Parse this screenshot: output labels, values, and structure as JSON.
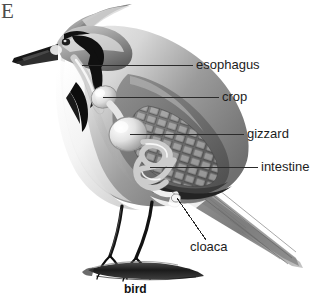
{
  "figure": {
    "panel_letter": "E",
    "caption": "bird",
    "background_color": "#ffffff",
    "label_color": "#1d1d1d",
    "leader_line_color": "#2b2b2b",
    "subject": "bird",
    "illustration_style": "grayscale anatomical drawing"
  },
  "labels": [
    {
      "id": "esophagus",
      "text": "esophagus"
    },
    {
      "id": "crop",
      "text": "crop"
    },
    {
      "id": "gizzard",
      "text": "gizzard"
    },
    {
      "id": "intestine",
      "text": "intestine"
    },
    {
      "id": "cloaca",
      "text": "cloaca"
    }
  ],
  "bird_parts": {
    "crest": "crest",
    "beak": "beak",
    "eye": "eye",
    "breast": "breast",
    "wing": "wing",
    "tail": "tail",
    "legs": "legs",
    "perch": "branch"
  }
}
